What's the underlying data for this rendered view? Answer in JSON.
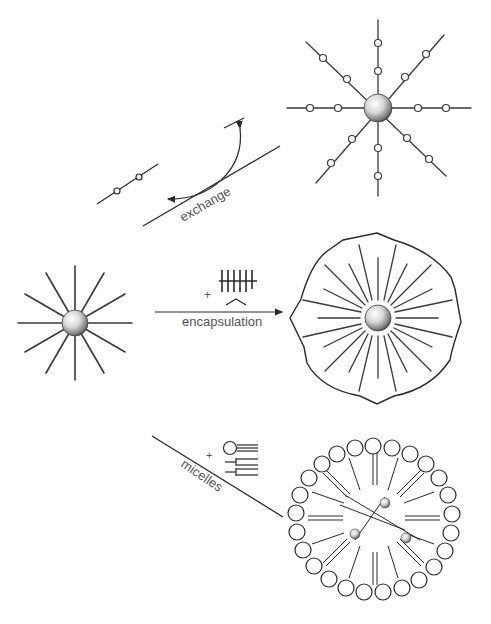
{
  "diagram": {
    "type": "nanoparticle-surface-modification-schematic",
    "colors": {
      "background": "#ffffff",
      "line": "#2a2a2a",
      "label": "#555555",
      "particle_highlight": "#ffffff",
      "particle_shadow": "#555555"
    },
    "nodes": [
      {
        "id": "np-hydrophobic",
        "label": "",
        "description": "Nanoparticle with 12 radiating hydrophobic ligands"
      },
      {
        "id": "np-exchanged",
        "label": "",
        "description": "Nanoparticle with 8 ligands bearing two functional circles each (after ligand exchange)"
      },
      {
        "id": "np-encapsulated",
        "label": "",
        "description": "Nanoparticle with ligands encapsulated by amphiphilic polymer shell"
      },
      {
        "id": "micelle",
        "label": "",
        "description": "Micelle of phospholipids containing three nanoparticles"
      }
    ],
    "edges": [
      {
        "from": "np-hydrophobic",
        "to": "np-exchanged",
        "label": "exchange"
      },
      {
        "from": "np-hydrophobic",
        "to": "np-encapsulated",
        "label": "encapsulation",
        "reagent_prefix": "+"
      },
      {
        "from": "np-hydrophobic",
        "to": "micelle",
        "label": "micelles",
        "reagent_prefix": "+"
      }
    ]
  },
  "labels": {
    "exchange": "exchange",
    "encapsulation": "encapsulation",
    "micelles": "micelles",
    "plus_encapsulation": "+",
    "plus_micelles": "+"
  }
}
